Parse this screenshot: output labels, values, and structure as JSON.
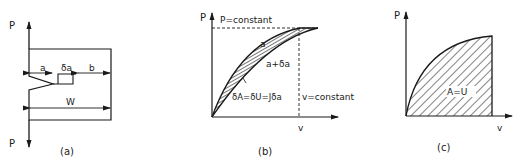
{
  "panel_a": {
    "caption": "(a)",
    "load_top": "P",
    "load_bottom": "P",
    "dim_a": "a",
    "dim_da": "δa",
    "dim_b": "b",
    "dim_w": "W"
  },
  "panel_b": {
    "caption": "(b)",
    "y_axis": "P",
    "x_axis": "v",
    "p_constant": "P=constant",
    "v_constant": "v=constant",
    "curve_a": "a",
    "curve_a_da": "a+δa",
    "area_label": "δA=δU=Jδa"
  },
  "panel_c": {
    "caption": "(c)",
    "y_axis": "P",
    "x_axis": "v",
    "area_label": "A=U"
  },
  "colors": {
    "ink": "#1a1a1a",
    "background": "#ffffff"
  }
}
